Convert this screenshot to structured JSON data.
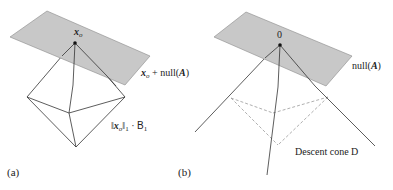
{
  "panel_a": {
    "caption": "(a)",
    "point_label_main": "x",
    "point_label_sub": "o",
    "plane_label_x": "x",
    "plane_label_sub": "o",
    "plane_label_rest": " + null(",
    "plane_label_A": "A",
    "plane_label_close": ")",
    "ball_label_open": "‖",
    "ball_label_x": "x",
    "ball_label_sub": "o",
    "ball_label_close": "‖",
    "ball_label_norm_sub": "1",
    "ball_label_dot": " · ",
    "ball_label_B": "B",
    "ball_label_B_sub": "1"
  },
  "panel_b": {
    "caption": "(b)",
    "point_label": "0",
    "plane_label_rest": "null(",
    "plane_label_A": "A",
    "plane_label_close": ")",
    "cone_label": "Descent cone D"
  },
  "colors": {
    "plane_fill": "#c8c8c8",
    "plane_stroke": "#8a8a8a",
    "line": "#333333",
    "dashed": "#9a9a9a"
  }
}
